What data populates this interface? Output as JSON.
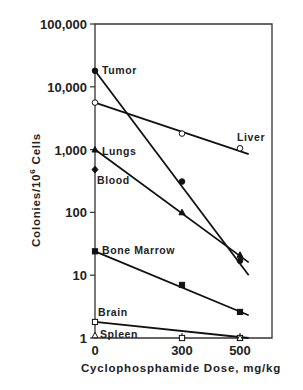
{
  "chart_data": {
    "type": "line",
    "title": "",
    "xlabel": "Cyclophosphamide Dose, mg/kg",
    "ylabel": "Colonies/10^6 Cells",
    "ylabel_display": "Colonies/10",
    "ylabel_sup": "6",
    "ylabel_tail": " Cells",
    "yscale": "log",
    "ylim": [
      1,
      100000
    ],
    "xlim": [
      0,
      550
    ],
    "x_ticks": [
      0,
      300,
      500
    ],
    "x_tick_labels": [
      "0",
      "300",
      "500"
    ],
    "y_ticks": [
      1,
      10,
      100,
      1000,
      10000,
      100000
    ],
    "y_tick_labels": [
      "1",
      "10",
      "100",
      "1,000",
      "10,000",
      "100,000"
    ],
    "grid": false,
    "legend": "inline labels",
    "series": [
      {
        "name": "Tumor",
        "marker": "filled-circle",
        "x": [
          0,
          300,
          500
        ],
        "values": [
          18000,
          310,
          17
        ],
        "line_end": [
          530,
          10
        ]
      },
      {
        "name": "Liver",
        "marker": "open-circle",
        "x": [
          0,
          300,
          500
        ],
        "values": [
          5600,
          1800,
          1050
        ],
        "line_end": [
          530,
          850
        ]
      },
      {
        "name": "Lungs",
        "marker": "filled-triangle",
        "x": [
          0,
          300,
          500
        ],
        "values": [
          1000,
          100,
          21
        ],
        "line_end": [
          530,
          16
        ]
      },
      {
        "name": "Blood",
        "marker": "filled-diamond",
        "x": [
          0
        ],
        "values": [
          480
        ]
      },
      {
        "name": "Bone Marrow",
        "marker": "filled-square",
        "x": [
          0,
          300,
          500
        ],
        "values": [
          24,
          7,
          2.6
        ],
        "line_end": [
          530,
          2.3
        ]
      },
      {
        "name": "Brain",
        "marker": "open-square",
        "x": [
          0,
          300,
          500
        ],
        "values": [
          1.8,
          1.0,
          0.95
        ],
        "line_end": [
          530,
          0.95
        ]
      },
      {
        "name": "Spleen",
        "marker": "open-triangle",
        "x": [
          0,
          500
        ],
        "values": [
          1.1,
          0.95
        ]
      }
    ]
  }
}
